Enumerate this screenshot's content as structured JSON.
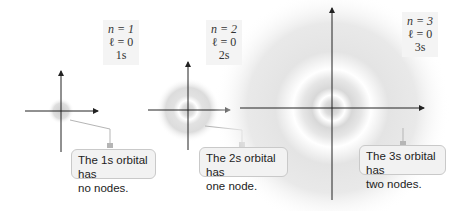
{
  "orbitals": [
    {
      "id": "1s",
      "n_line": "n = 1",
      "l_line": "ℓ = 0",
      "label": "1s",
      "callout_line1": "The 1s orbital has",
      "callout_line2": "no nodes."
    },
    {
      "id": "2s",
      "n_line": "n = 2",
      "l_line": "ℓ = 0",
      "label": "2s",
      "callout_line1": "The 2s orbital has",
      "callout_line2": "one node."
    },
    {
      "id": "3s",
      "n_line": "n = 3",
      "l_line": "ℓ = 0",
      "label": "3s",
      "callout_line1": "The 3s orbital has",
      "callout_line2": "two nodes."
    }
  ],
  "colors": {
    "axis": "#222222",
    "cloud": "#c8c8c8",
    "callout_bg": "#f2f2f2",
    "callout_border": "#c9c9c9",
    "leader": "#b5b5b5",
    "box_bg": "#f4f4f4"
  }
}
